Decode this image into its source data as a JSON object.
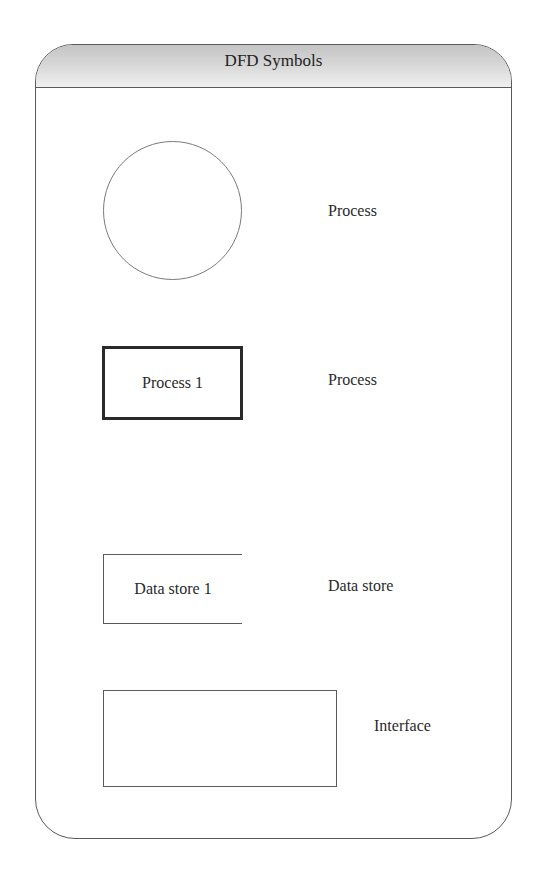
{
  "panel": {
    "title": "DFD Symbols"
  },
  "symbols": [
    {
      "shape": "circle",
      "inner_text": "",
      "label": "Process"
    },
    {
      "shape": "thick-rectangle",
      "inner_text": "Process 1",
      "label": "Process"
    },
    {
      "shape": "open-rectangle",
      "inner_text": "Data store 1",
      "label": "Data store"
    },
    {
      "shape": "rectangle",
      "inner_text": "",
      "label": "Interface"
    }
  ],
  "colors": {
    "border": "#5a5a5a",
    "text": "#2a2a2a",
    "header_gradient_top": "#c4c4c4",
    "header_gradient_bottom": "#f0f0f0"
  }
}
